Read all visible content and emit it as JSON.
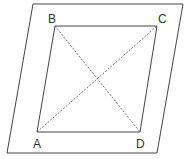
{
  "diagram": {
    "type": "geometry",
    "colors": {
      "background": "#ffffff",
      "stroke": "#444444",
      "label": "#333333"
    },
    "plane": {
      "points": [
        [
          33,
          4
        ],
        [
          183,
          4
        ],
        [
          157,
          153
        ],
        [
          7,
          153
        ]
      ]
    },
    "vertices": [
      {
        "label": "A",
        "x": 37,
        "y": 132,
        "label_x": 33,
        "label_y": 148
      },
      {
        "label": "B",
        "x": 55,
        "y": 26,
        "label_x": 48,
        "label_y": 23
      },
      {
        "label": "C",
        "x": 157,
        "y": 26,
        "label_x": 158,
        "label_y": 23
      },
      {
        "label": "D",
        "x": 140,
        "y": 132,
        "label_x": 136,
        "label_y": 148
      }
    ],
    "edges": [
      [
        "A",
        "B"
      ],
      [
        "B",
        "C"
      ],
      [
        "C",
        "D"
      ],
      [
        "D",
        "A"
      ]
    ],
    "diagonals": [
      [
        "A",
        "C"
      ],
      [
        "B",
        "D"
      ]
    ],
    "labels": {
      "a": "A",
      "b": "B",
      "c": "C",
      "d": "D"
    }
  }
}
